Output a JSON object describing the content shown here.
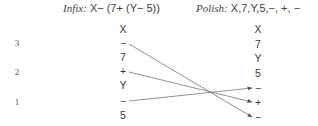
{
  "infix": {
    "label": "Infix:",
    "expression": "X− (7+ (Y− 5))",
    "column": [
      "X",
      "−",
      "7",
      "+",
      "Y",
      "−",
      "5"
    ]
  },
  "polish": {
    "label": "Polish:",
    "expression": "X,7,Y,5,−, +, −",
    "column": [
      "X",
      "7",
      "Y",
      "5",
      "−",
      "+",
      "−"
    ]
  },
  "levels": [
    "3",
    "2",
    "1"
  ],
  "arrows": [
    {
      "from": "infix operator − (level 3)",
      "to": "polish last −"
    },
    {
      "from": "infix operator + (level 2)",
      "to": "polish +"
    },
    {
      "from": "infix operator − (level 1)",
      "to": "polish first −"
    }
  ],
  "colors": {
    "line": "#6a6a6a",
    "text": "#3a3a3a"
  }
}
